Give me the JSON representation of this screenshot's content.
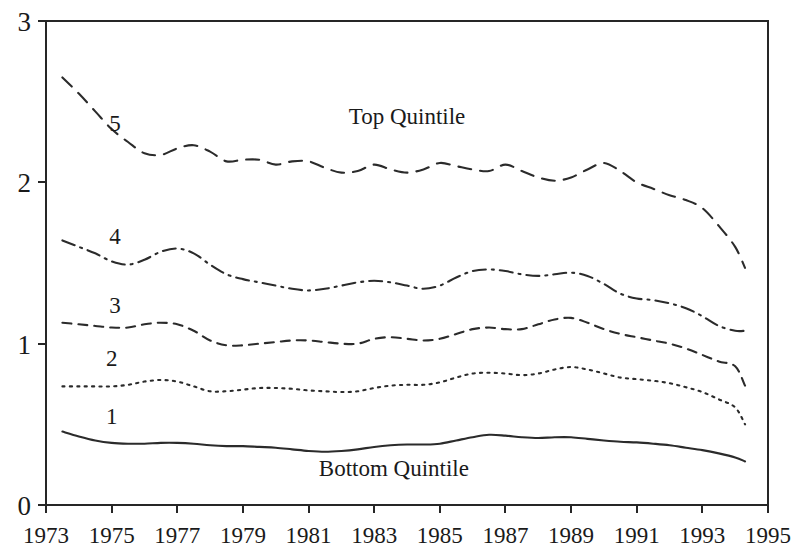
{
  "chart_data": {
    "type": "line",
    "title": "",
    "xlabel": "",
    "ylabel": "",
    "xlim": [
      1973,
      1995
    ],
    "ylim": [
      0,
      3
    ],
    "grid": false,
    "legend_position": "inline-labels",
    "xticks": [
      "1973",
      "1975",
      "1977",
      "1979",
      "1981",
      "1983",
      "1985",
      "1987",
      "1989",
      "1991",
      "1993",
      "1995"
    ],
    "xtick_values": [
      1973,
      1975,
      1977,
      1979,
      1981,
      1983,
      1985,
      1987,
      1989,
      1991,
      1993,
      1995
    ],
    "yticks": [
      "0",
      "1",
      "2",
      "3"
    ],
    "ytick_values": [
      0,
      1,
      2,
      3
    ],
    "x": [
      1973.5,
      1974,
      1974.5,
      1975,
      1975.5,
      1976,
      1976.5,
      1977,
      1977.5,
      1978,
      1978.5,
      1979,
      1979.5,
      1980,
      1980.5,
      1981,
      1981.5,
      1982,
      1982.5,
      1983,
      1983.5,
      1984,
      1984.5,
      1985,
      1985.5,
      1986,
      1986.5,
      1987,
      1987.5,
      1988,
      1988.5,
      1989,
      1989.5,
      1990,
      1990.5,
      1991,
      1991.5,
      1992,
      1992.5,
      1993,
      1993.5,
      1994,
      1994.3
    ],
    "annotations": [
      {
        "text": "Top Quintile",
        "x": 1984.0,
        "y": 2.36
      },
      {
        "text": "Bottom Quintile",
        "x": 1983.6,
        "y": 0.18
      }
    ],
    "series": [
      {
        "name": "5",
        "label": "Top Quintile",
        "tag": "5",
        "tag_x": 1975.1,
        "tag_y": 2.32,
        "linestyle": "dashed",
        "dasharray": "13 9",
        "values": [
          2.65,
          2.55,
          2.44,
          2.33,
          2.25,
          2.18,
          2.17,
          2.21,
          2.23,
          2.19,
          2.13,
          2.14,
          2.14,
          2.11,
          2.13,
          2.13,
          2.09,
          2.06,
          2.07,
          2.11,
          2.08,
          2.06,
          2.08,
          2.12,
          2.1,
          2.08,
          2.07,
          2.11,
          2.07,
          2.03,
          2.01,
          2.03,
          2.08,
          2.12,
          2.07,
          2.0,
          1.96,
          1.92,
          1.89,
          1.84,
          1.73,
          1.6,
          1.47
        ]
      },
      {
        "name": "4",
        "label": "Fourth Quintile",
        "tag": "4",
        "tag_x": 1975.1,
        "tag_y": 1.62,
        "linestyle": "dashdot",
        "dasharray": "13 6 2 6",
        "values": [
          1.64,
          1.6,
          1.56,
          1.51,
          1.49,
          1.52,
          1.57,
          1.59,
          1.56,
          1.49,
          1.43,
          1.4,
          1.38,
          1.36,
          1.34,
          1.33,
          1.34,
          1.36,
          1.38,
          1.39,
          1.38,
          1.36,
          1.34,
          1.36,
          1.41,
          1.45,
          1.46,
          1.45,
          1.43,
          1.42,
          1.43,
          1.44,
          1.42,
          1.37,
          1.31,
          1.28,
          1.27,
          1.25,
          1.22,
          1.17,
          1.11,
          1.08,
          1.08
        ]
      },
      {
        "name": "3",
        "label": "Third Quintile",
        "tag": "3",
        "tag_x": 1975.1,
        "tag_y": 1.19,
        "linestyle": "dashed-short",
        "dasharray": "9 7",
        "values": [
          1.13,
          1.12,
          1.11,
          1.1,
          1.1,
          1.12,
          1.13,
          1.12,
          1.08,
          1.02,
          0.99,
          0.99,
          1.0,
          1.01,
          1.02,
          1.02,
          1.01,
          1.0,
          1.0,
          1.03,
          1.04,
          1.03,
          1.02,
          1.03,
          1.06,
          1.09,
          1.1,
          1.09,
          1.09,
          1.12,
          1.15,
          1.16,
          1.13,
          1.09,
          1.06,
          1.04,
          1.02,
          1.0,
          0.97,
          0.93,
          0.89,
          0.86,
          0.74
        ]
      },
      {
        "name": "2",
        "label": "Second Quintile",
        "tag": "2",
        "tag_x": 1975.0,
        "tag_y": 0.86,
        "linestyle": "dotted",
        "dasharray": "2.2 5.2",
        "values": [
          0.735,
          0.735,
          0.735,
          0.735,
          0.745,
          0.765,
          0.775,
          0.765,
          0.735,
          0.705,
          0.705,
          0.715,
          0.725,
          0.725,
          0.72,
          0.71,
          0.705,
          0.7,
          0.705,
          0.725,
          0.74,
          0.745,
          0.745,
          0.76,
          0.79,
          0.815,
          0.82,
          0.815,
          0.805,
          0.815,
          0.84,
          0.855,
          0.84,
          0.815,
          0.79,
          0.78,
          0.77,
          0.755,
          0.73,
          0.7,
          0.655,
          0.605,
          0.5
        ]
      },
      {
        "name": "1",
        "label": "Bottom Quintile",
        "tag": "1",
        "tag_x": 1975.0,
        "tag_y": 0.5,
        "linestyle": "solid",
        "dasharray": "",
        "values": [
          0.455,
          0.425,
          0.4,
          0.385,
          0.38,
          0.38,
          0.385,
          0.385,
          0.38,
          0.37,
          0.365,
          0.365,
          0.36,
          0.355,
          0.345,
          0.335,
          0.33,
          0.335,
          0.345,
          0.36,
          0.37,
          0.375,
          0.375,
          0.38,
          0.4,
          0.42,
          0.435,
          0.43,
          0.42,
          0.415,
          0.42,
          0.42,
          0.41,
          0.4,
          0.392,
          0.388,
          0.38,
          0.37,
          0.355,
          0.34,
          0.32,
          0.295,
          0.27
        ]
      }
    ]
  },
  "axes": {
    "y_axis_name": "ratio-axis",
    "x_axis_name": "year-axis"
  }
}
